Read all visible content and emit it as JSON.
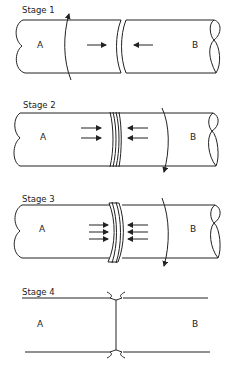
{
  "diagram": {
    "type": "friction-welding-stages",
    "colors": {
      "line": "#222222",
      "background": "#ffffff"
    },
    "stages": [
      {
        "label": "Stage 1",
        "left_part": "A",
        "right_part": "B",
        "arrows_per_side": 1,
        "rotation_direction": "up",
        "joint": "contact"
      },
      {
        "label": "Stage 2",
        "left_part": "A",
        "right_part": "B",
        "arrows_per_side": 2,
        "rotation_direction": "down",
        "joint": "heating"
      },
      {
        "label": "Stage 3",
        "left_part": "A",
        "right_part": "B",
        "arrows_per_side": 3,
        "rotation_direction": "down",
        "joint": "upset"
      },
      {
        "label": "Stage 4",
        "left_part": "A",
        "right_part": "B",
        "arrows_per_side": 0,
        "rotation_direction": "none",
        "joint": "welded-flash"
      }
    ]
  }
}
